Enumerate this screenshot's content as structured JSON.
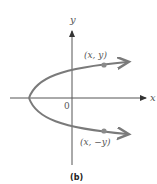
{
  "figure": {
    "caption": "(b)",
    "axes": {
      "x_label": "x",
      "y_label": "y",
      "origin_label": "0"
    },
    "points": [
      {
        "label": "(x, y)"
      },
      {
        "label": "(x, −y)"
      }
    ],
    "colors": {
      "curve": "#7a7a7a",
      "axis": "#444444",
      "point": "#8a8a8a"
    }
  }
}
